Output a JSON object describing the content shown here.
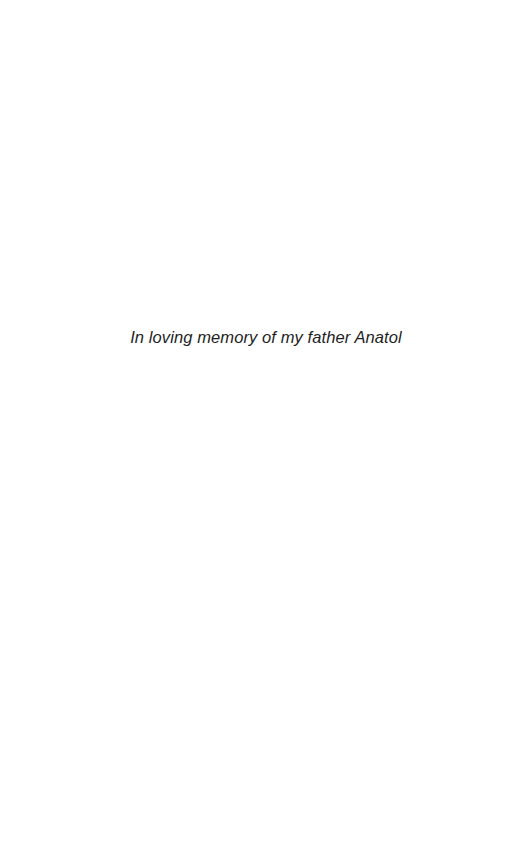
{
  "page": {
    "dedication": "In loving memory of my father Anatol"
  }
}
